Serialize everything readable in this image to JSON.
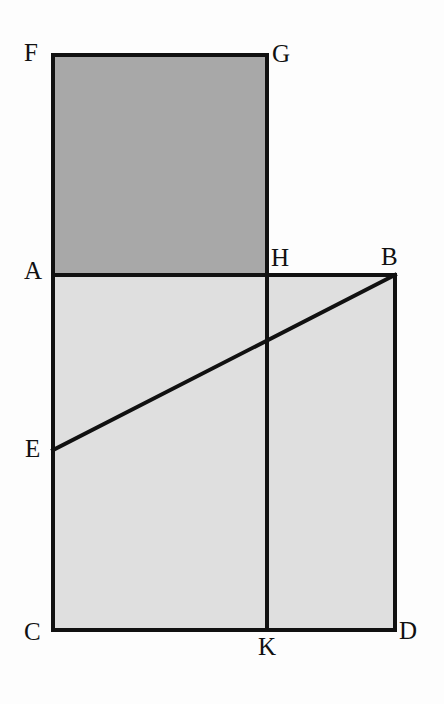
{
  "figure": {
    "background_color": "#fdfdfd",
    "stroke_color": "#111111",
    "stroke_width": 4,
    "fills": {
      "upper_rectangle_color": "#a8a8a8",
      "lower_square_color": "#dfdfdf"
    }
  },
  "vertices": [
    {
      "label": "F",
      "x": 53,
      "y": 55,
      "label_x": 24,
      "label_y": 40
    },
    {
      "label": "G",
      "x": 267,
      "y": 55,
      "label_x": 272,
      "label_y": 41
    },
    {
      "label": "A",
      "x": 53,
      "y": 275,
      "label_x": 24,
      "label_y": 258
    },
    {
      "label": "H",
      "x": 267,
      "y": 275,
      "label_x": 271,
      "label_y": 245
    },
    {
      "label": "B",
      "x": 395,
      "y": 275,
      "label_x": 381,
      "label_y": 244
    },
    {
      "label": "E",
      "x": 53,
      "y": 450,
      "label_x": 25,
      "label_y": 436
    },
    {
      "label": "C",
      "x": 53,
      "y": 630,
      "label_x": 24,
      "label_y": 619
    },
    {
      "label": "K",
      "x": 267,
      "y": 630,
      "label_x": 258,
      "label_y": 634
    },
    {
      "label": "D",
      "x": 395,
      "y": 630,
      "label_x": 399,
      "label_y": 618
    }
  ],
  "shapes": {
    "upper_rectangle": {
      "name": "FGHA",
      "points": "53,55 267,55 267,275 53,275",
      "fill": "#a8a8a8"
    },
    "lower_square": {
      "name": "ABDC",
      "points": "53,275 395,275 395,630 53,630",
      "fill": "#dfdfdf"
    }
  },
  "segments": [
    {
      "name": "FG",
      "x1": 53,
      "y1": 55,
      "x2": 267,
      "y2": 55
    },
    {
      "name": "FA",
      "x1": 53,
      "y1": 55,
      "x2": 53,
      "y2": 275
    },
    {
      "name": "GH",
      "x1": 267,
      "y1": 55,
      "x2": 267,
      "y2": 275
    },
    {
      "name": "AB",
      "x1": 53,
      "y1": 275,
      "x2": 395,
      "y2": 275
    },
    {
      "name": "AC",
      "x1": 53,
      "y1": 275,
      "x2": 53,
      "y2": 630
    },
    {
      "name": "BD",
      "x1": 395,
      "y1": 275,
      "x2": 395,
      "y2": 630
    },
    {
      "name": "CD",
      "x1": 53,
      "y1": 630,
      "x2": 395,
      "y2": 630
    },
    {
      "name": "HK",
      "x1": 267,
      "y1": 275,
      "x2": 267,
      "y2": 630
    },
    {
      "name": "EB",
      "x1": 53,
      "y1": 450,
      "x2": 395,
      "y2": 275
    }
  ]
}
